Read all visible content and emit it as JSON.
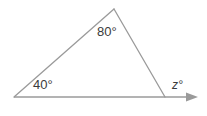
{
  "figure": {
    "type": "triangle-exterior-angle-diagram",
    "background_color": "#ffffff",
    "stroke_color": "#9a9a9a",
    "text_color": "#3b3b3b",
    "stroke_width": 1.3
  },
  "labels": {
    "vertex_left_angle": "40°",
    "vertex_apex_angle": "80°",
    "exterior_angle": "z°"
  },
  "geometry": {
    "vertex_left": {
      "x": 14,
      "y": 97
    },
    "vertex_apex": {
      "x": 114,
      "y": 9
    },
    "vertex_right": {
      "x": 165,
      "y": 97
    },
    "ray_end": {
      "x": 198,
      "y": 97
    },
    "arrow_tip": {
      "x": 198,
      "y": 97
    },
    "arrow_base_x": 186
  },
  "icons": {
    "arrow": "arrow-right-icon"
  }
}
